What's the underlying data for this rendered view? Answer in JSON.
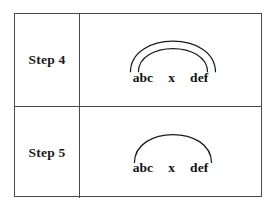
{
  "figure": {
    "type": "dependency-arc-diagram",
    "border_color": "#4a4a4a",
    "arc_color": "#1a1a1a",
    "text_color": "#111111",
    "background": "#ffffff"
  },
  "rows": [
    {
      "label": "Step 4",
      "tokens": [
        "abc",
        "x",
        "def"
      ],
      "arc_count": 2,
      "arcs": [
        {
          "from": "abc",
          "to": "def",
          "level": "outer"
        },
        {
          "from": "abc",
          "to": "def",
          "level": "inner"
        }
      ]
    },
    {
      "label": "Step 5",
      "tokens": [
        "abc",
        "x",
        "def"
      ],
      "arc_count": 1,
      "arcs": [
        {
          "from": "abc",
          "to": "def",
          "level": "outer"
        }
      ]
    }
  ]
}
